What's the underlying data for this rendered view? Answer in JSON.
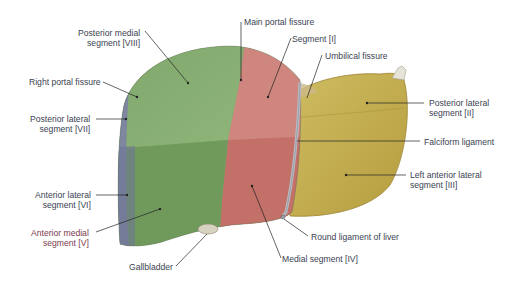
{
  "figure": {
    "colors": {
      "right_posterior": "#6f8a5e",
      "right_anterior_green": "#7fa868",
      "medial_red": "#c97a72",
      "left_lobe_yellow": "#c4b052",
      "lateral_edge_blue": "#7e86a0",
      "ligament_gray": "#b9bcc4",
      "leader_line": "#222222",
      "label_text": "#3a3f52"
    }
  },
  "labels": {
    "posterior_medial": {
      "line1": "Posterior medial",
      "line2": "segment [VIII]"
    },
    "right_portal_fissure": {
      "line1": "Right portal fissure"
    },
    "posterior_lateral_right": {
      "line1": "Posterior lateral",
      "line2": "segment [VII]"
    },
    "anterior_lateral": {
      "line1": "Anterior lateral",
      "line2": "segment [VI]"
    },
    "anterior_medial": {
      "line1": "Anterior medial",
      "line2": "segment [V]"
    },
    "gallbladder": {
      "line1": "Gallbladder"
    },
    "main_portal_fissure": {
      "line1": "Main portal fissure"
    },
    "segment_i": {
      "line1": "Segment [I]"
    },
    "umbilical_fissure": {
      "line1": "Umbilical fissure"
    },
    "posterior_lateral_left": {
      "line1": "Posterior lateral",
      "line2": "segment [II]"
    },
    "falciform_ligament": {
      "line1": "Falciform ligament"
    },
    "left_anterior_lateral": {
      "line1": "Left anterior lateral",
      "line2": "segment [III]"
    },
    "round_ligament": {
      "line1": "Round ligament of liver"
    },
    "medial_segment": {
      "line1": "Medial segment [IV]"
    }
  }
}
